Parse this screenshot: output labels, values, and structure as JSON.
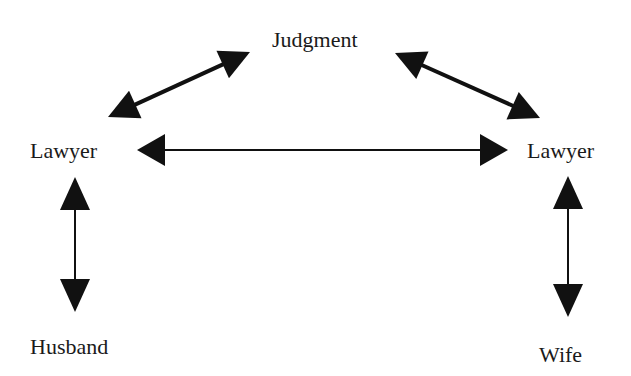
{
  "diagram": {
    "colors": {
      "background": "#ffffff",
      "stroke": "#111111",
      "text": "#1a1a1a"
    },
    "nodes": {
      "judgment": {
        "label": "Judgment",
        "x": 272,
        "y": 29
      },
      "lawyer_left": {
        "label": "Lawyer",
        "x": 30,
        "y": 140
      },
      "lawyer_right": {
        "label": "Lawyer",
        "x": 527,
        "y": 140
      },
      "husband": {
        "label": "Husband",
        "x": 30,
        "y": 336
      },
      "wife": {
        "label": "Wife",
        "x": 539,
        "y": 344
      }
    },
    "edges": [
      {
        "id": "lawyer-left-to-judgment",
        "from": "lawyer_left",
        "to": "judgment",
        "type": "bidirectional",
        "x1": 108,
        "y1": 117,
        "x2": 250,
        "y2": 52,
        "stroke_width": 4,
        "head_len": 30,
        "head_w": 30
      },
      {
        "id": "judgment-to-lawyer-right",
        "from": "judgment",
        "to": "lawyer_right",
        "type": "bidirectional",
        "x1": 395,
        "y1": 53,
        "x2": 540,
        "y2": 118,
        "stroke_width": 4,
        "head_len": 30,
        "head_w": 30
      },
      {
        "id": "lawyer-left-to-lawyer-right",
        "from": "lawyer_left",
        "to": "lawyer_right",
        "type": "bidirectional",
        "x1": 137,
        "y1": 150,
        "x2": 508,
        "y2": 150,
        "stroke_width": 2,
        "head_len": 28,
        "head_w": 32
      },
      {
        "id": "lawyer-left-to-husband",
        "from": "lawyer_left",
        "to": "husband",
        "type": "bidirectional",
        "x1": 75,
        "y1": 177,
        "x2": 75,
        "y2": 312,
        "stroke_width": 2,
        "head_len": 33,
        "head_w": 30
      },
      {
        "id": "lawyer-right-to-wife",
        "from": "lawyer_right",
        "to": "wife",
        "type": "bidirectional",
        "x1": 568,
        "y1": 176,
        "x2": 568,
        "y2": 317,
        "stroke_width": 2,
        "head_len": 33,
        "head_w": 30
      }
    ]
  }
}
